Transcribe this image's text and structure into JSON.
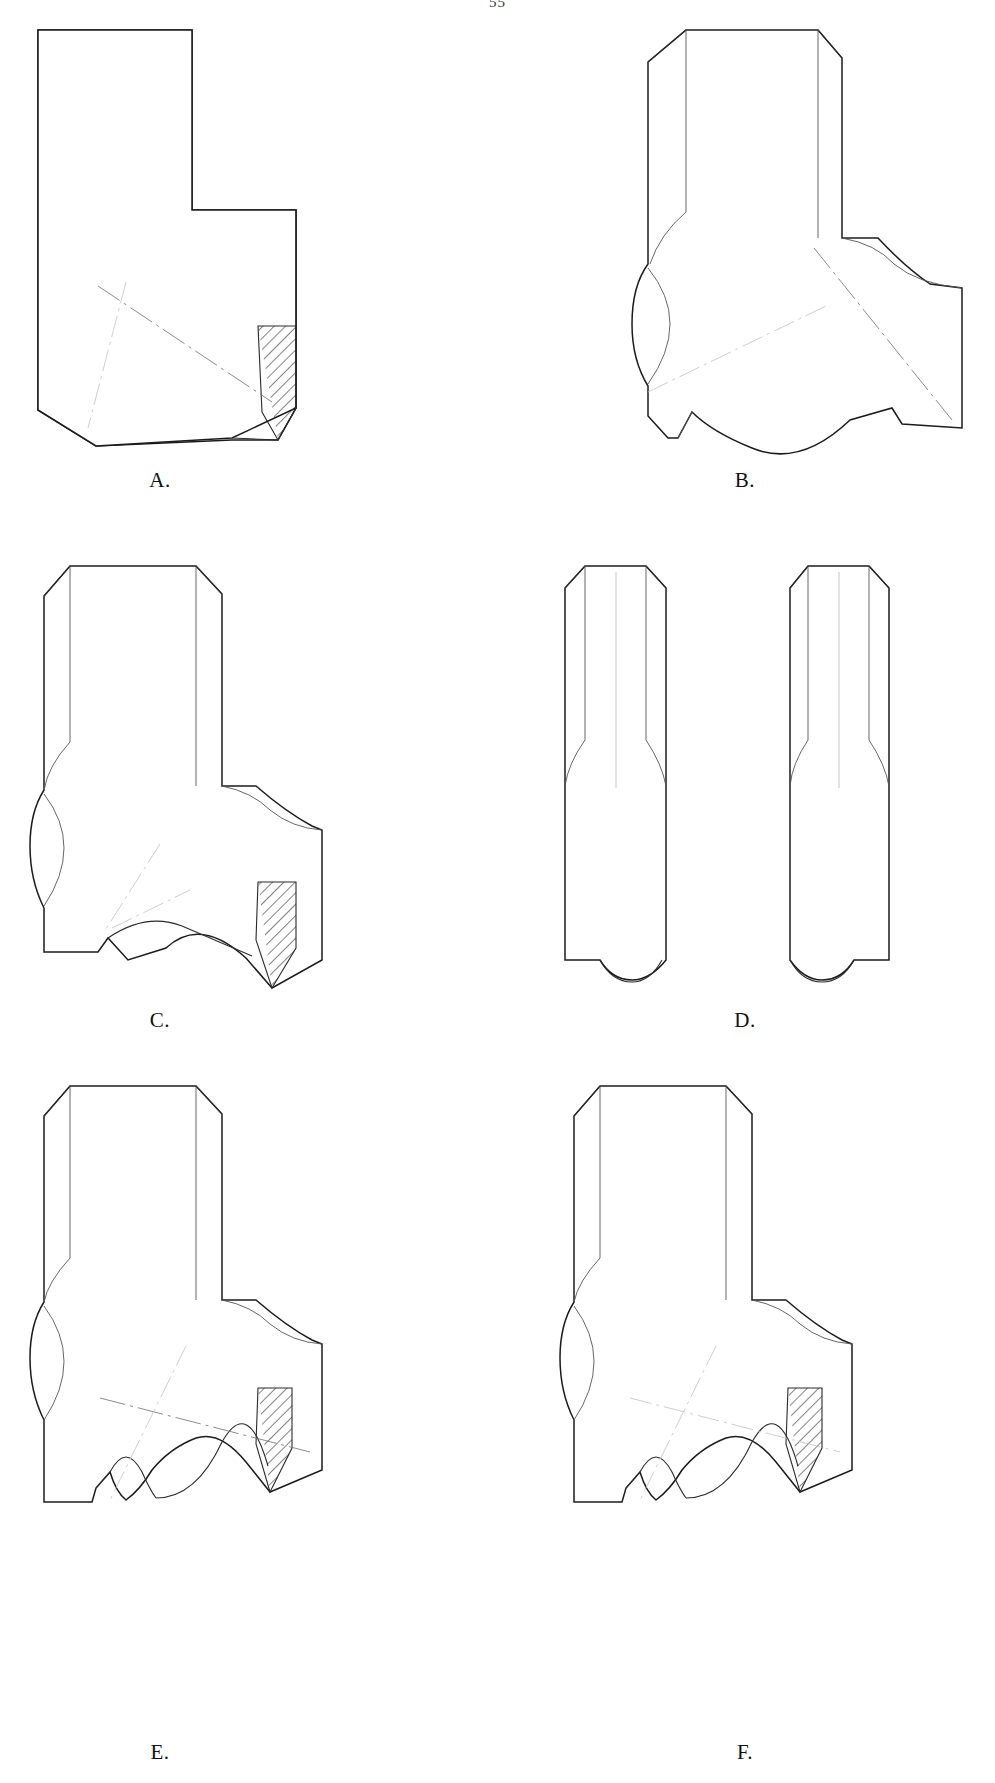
{
  "plate": {
    "page_number": "55",
    "caption_style": "letter-period",
    "background_color": "#ffffff",
    "ink_color": "#1b1b1b",
    "centerline_color": "#6d6d6d",
    "ghost_color": "#c2c2c2"
  },
  "figures": [
    {
      "id": "A",
      "label": "A.",
      "label_x": 160,
      "label_y": 468,
      "description": "Stepped L-shaped profile, plain square upper shank with rectangular lower body, hatched section wedge at lower right and a single long dash-dot centerline running diagonally across the lower body.",
      "features": [
        "square-shoulder",
        "hatched-section-wedge",
        "diagonal-centerline",
        "bevelled-lower-left-corner"
      ]
    },
    {
      "id": "B",
      "label": "B.",
      "label_x": 745,
      "label_y": 468,
      "description": "Chamfered-top shank with concave flute on left edge, curved cove transition to the right arm and a deep ogee wave along the bottom edge; two crossing dash-dot centerlines, no hatching.",
      "features": [
        "chamfered-top",
        "left-flute",
        "cove-transition",
        "ogee-bottom",
        "crossed-centerlines"
      ]
    },
    {
      "id": "C",
      "label": "C.",
      "label_x": 160,
      "label_y": 1008,
      "description": "Chamfered-top shank with left flute and lens-shaped side relief, curved cove shoulder on the right, single broad ogee wave bottom and a hatched section wedge at lower right tapering to a point.",
      "features": [
        "chamfered-top",
        "left-flute",
        "lens-relief",
        "cove-shoulder",
        "single-ogee-bottom",
        "hatched-section-wedge"
      ]
    },
    {
      "id": "D",
      "label": "D.",
      "label_x": 745,
      "label_y": 1008,
      "description": "Two narrow parallel bar profiles shown side by side, each with chamfered top corners, faint interior ghost lines and a small rounded notch cut into the bottom edge.",
      "features": [
        "paired-bars",
        "chamfered-top-corners",
        "ghost-interior-lines",
        "rounded-bottom-notch"
      ],
      "sub_parts": 2
    },
    {
      "id": "E",
      "label": "E.",
      "label_x": 160,
      "label_y": 1740,
      "description": "Chamfered-top shank with left flute and lens relief, cove shoulder right, compound bottom edge with a small bump lobe then a long sweeping ogee; hatched section wedge at lower right with crossing centerlines.",
      "features": [
        "chamfered-top",
        "left-flute",
        "lens-relief",
        "cove-shoulder",
        "bump-plus-ogee-bottom",
        "hatched-section-wedge",
        "crossed-centerlines"
      ]
    },
    {
      "id": "F",
      "label": "F.",
      "label_x": 745,
      "label_y": 1740,
      "description": "Mirror-family variant of E: chamfered-top shank, left flute and lens relief, cove shoulder right, bump lobe and long ogee bottom, hatched section wedge at lower right with faint dash-dot centerlines.",
      "features": [
        "chamfered-top",
        "left-flute",
        "lens-relief",
        "cove-shoulder",
        "bump-plus-ogee-bottom",
        "hatched-section-wedge",
        "faint-centerlines"
      ]
    }
  ]
}
